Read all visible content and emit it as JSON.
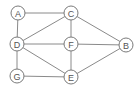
{
  "diagram": {
    "type": "undirected-graph",
    "nodes": [
      {
        "id": "A",
        "label": "A",
        "x": 18,
        "y": 13
      },
      {
        "id": "C",
        "label": "C",
        "x": 71,
        "y": 13
      },
      {
        "id": "D",
        "label": "D",
        "x": 17,
        "y": 44
      },
      {
        "id": "F",
        "label": "F",
        "x": 71,
        "y": 44
      },
      {
        "id": "B",
        "label": "B",
        "x": 126,
        "y": 45
      },
      {
        "id": "G",
        "label": "G",
        "x": 17,
        "y": 76
      },
      {
        "id": "E",
        "label": "E",
        "x": 71,
        "y": 77
      }
    ],
    "edges": [
      [
        "A",
        "C"
      ],
      [
        "A",
        "D"
      ],
      [
        "C",
        "D"
      ],
      [
        "C",
        "F"
      ],
      [
        "C",
        "B"
      ],
      [
        "D",
        "F"
      ],
      [
        "D",
        "E"
      ],
      [
        "D",
        "G"
      ],
      [
        "F",
        "B"
      ],
      [
        "F",
        "E"
      ],
      [
        "G",
        "E"
      ],
      [
        "E",
        "B"
      ]
    ],
    "node_radius": 7,
    "colors": {
      "edge": "#8a8a8a",
      "node_stroke": "#7a7a7a",
      "label": "#555555",
      "background": "#ffffff"
    }
  }
}
